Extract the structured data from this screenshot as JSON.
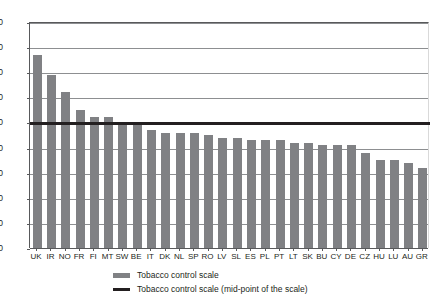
{
  "chart_data": {
    "type": "bar",
    "title": "",
    "xlabel": "",
    "ylabel": "",
    "ylim": [
      0,
      90
    ],
    "ytick_step": 10,
    "yticks": [
      0,
      10,
      20,
      30,
      40,
      50,
      60,
      70,
      80,
      90
    ],
    "grid": true,
    "legend_position": "bottom",
    "categories": [
      "UK",
      "IR",
      "NO",
      "FR",
      "FI",
      "MT",
      "SW",
      "BE",
      "IT",
      "DK",
      "NL",
      "SP",
      "RO",
      "LV",
      "SL",
      "ES",
      "PL",
      "PT",
      "LT",
      "SK",
      "BU",
      "CY",
      "DE",
      "CZ",
      "HU",
      "LU",
      "AU",
      "GR"
    ],
    "series": [
      {
        "name": "Tobacco control scale",
        "type": "bar",
        "color": "#808184",
        "values": [
          77,
          69,
          62,
          55,
          52,
          52,
          49,
          49,
          47,
          46,
          46,
          46,
          45,
          44,
          44,
          43,
          43,
          43,
          42,
          42,
          41,
          41,
          41,
          38,
          35,
          35,
          34,
          32
        ]
      },
      {
        "name": "Tobacco control scale (mid-point of the scale)",
        "type": "line",
        "color": "#231f20",
        "constant_value": 50
      }
    ]
  },
  "legend": {
    "items": [
      {
        "label": "Tobacco control scale"
      },
      {
        "label": "Tobacco control scale (mid-point of the scale)"
      }
    ]
  }
}
